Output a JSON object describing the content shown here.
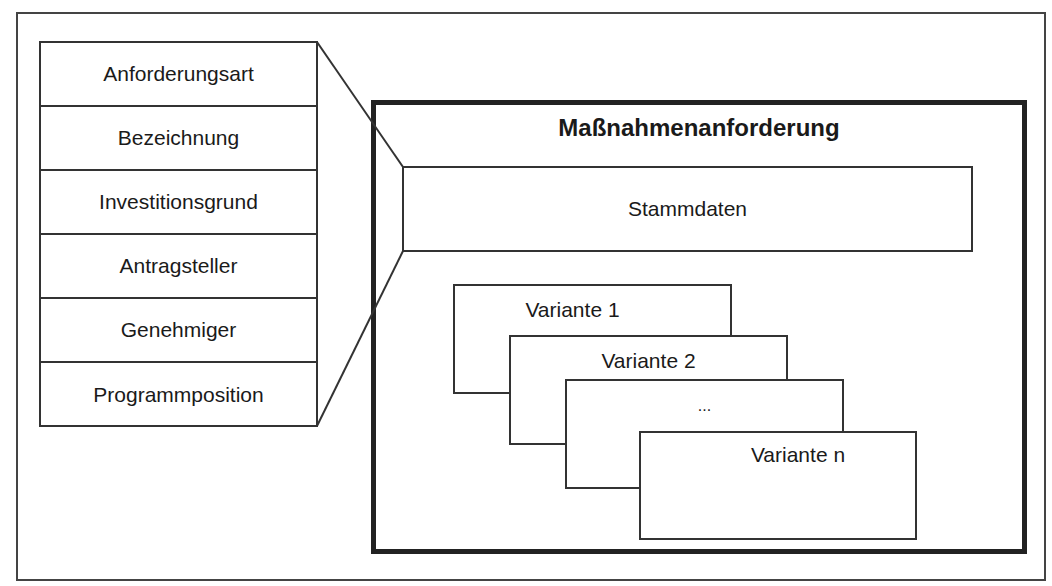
{
  "diagram": {
    "title": "Maßnahmenanforderung",
    "attributes": [
      "Anforderungsart",
      "Bezeichnung",
      "Investitionsgrund",
      "Antragsteller",
      "Genehmiger",
      "Programmposition"
    ],
    "master_data_label": "Stammdaten",
    "variants": [
      "Variante 1",
      "Variante 2",
      "...",
      "Variante n"
    ],
    "colors": {
      "line": "#333333",
      "background": "#ffffff"
    }
  }
}
